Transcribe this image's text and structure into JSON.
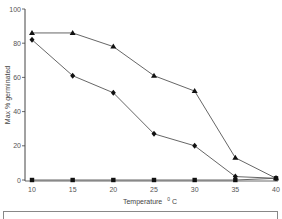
{
  "chart_data": {
    "type": "line",
    "title": "",
    "xlabel": "Temperature °C",
    "ylabel": "Max % germinated",
    "x": [
      10,
      15,
      20,
      25,
      30,
      35,
      40
    ],
    "xlim": [
      10,
      40
    ],
    "ylim": [
      0,
      100
    ],
    "xticks": [
      10,
      15,
      20,
      25,
      30,
      35,
      40
    ],
    "yticks": [
      0,
      20,
      40,
      60,
      80,
      100
    ],
    "grid": false,
    "series": [
      {
        "name": "triangle",
        "marker": "triangle",
        "values": [
          86,
          86,
          78,
          61,
          52,
          13,
          1
        ]
      },
      {
        "name": "diamond",
        "marker": "diamond",
        "values": [
          82,
          61,
          51,
          27,
          20,
          2,
          1
        ]
      },
      {
        "name": "square",
        "marker": "square",
        "values": [
          0,
          0,
          0,
          0,
          0,
          0,
          1
        ]
      }
    ],
    "legend": {
      "position": "bottom",
      "entries": []
    }
  },
  "axes": {
    "xlabel_main": "Temperature",
    "xlabel_unit_sup": "0",
    "xlabel_unit": "C",
    "ylabel": "Max % germinated"
  },
  "colors": {
    "line": "#555555",
    "marker": "#111111",
    "axis": "#444444"
  }
}
